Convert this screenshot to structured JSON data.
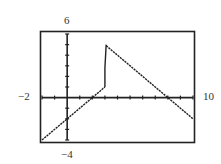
{
  "chart_data": {
    "type": "line",
    "title": "",
    "xlabel": "",
    "ylabel": "",
    "xlim": [
      -2,
      10
    ],
    "ylim": [
      -4,
      6
    ],
    "xscl": 1,
    "yscl": 1,
    "window_labels": {
      "xmin": "−2",
      "xmax": "10",
      "ymin": "−4",
      "ymax": "6"
    },
    "series": [
      {
        "name": "f(x), x ≤ 3 : y = x − 2",
        "x": [
          -2,
          3
        ],
        "y": [
          -4,
          1
        ]
      },
      {
        "name": "vertical jump segment (calculator connected mode)",
        "x": [
          3,
          3,
          3.1
        ],
        "y": [
          1,
          2.8,
          5
        ]
      },
      {
        "name": "f(x), x > 3 : y = 8 − x",
        "x": [
          3.1,
          10
        ],
        "y": [
          4.9,
          -2
        ]
      }
    ],
    "grid": false,
    "legend": "none"
  }
}
